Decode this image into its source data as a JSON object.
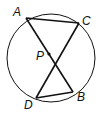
{
  "diagram": {
    "type": "circle-intersecting-chords",
    "colors": {
      "stroke": "#111111",
      "background": "#ffffff"
    },
    "circle": {
      "cx": 51,
      "cy": 58,
      "r": 44
    },
    "points": {
      "A": {
        "label": "A",
        "x": 26,
        "y": 18,
        "lx": 13,
        "ly": 16
      },
      "C": {
        "label": "C",
        "x": 79,
        "y": 23,
        "lx": 82,
        "ly": 25
      },
      "P": {
        "label": "P",
        "x": 49,
        "y": 54,
        "lx": 36,
        "ly": 60
      },
      "D": {
        "label": "D",
        "x": 36,
        "y": 98,
        "lx": 24,
        "ly": 109
      },
      "B": {
        "label": "B",
        "x": 73,
        "y": 92,
        "lx": 77,
        "ly": 101
      }
    },
    "segments": [
      {
        "from": "A",
        "to": "C",
        "name": "AC"
      },
      {
        "from": "A",
        "to": "B",
        "name": "AB"
      },
      {
        "from": "C",
        "to": "D",
        "name": "CD"
      },
      {
        "from": "D",
        "to": "B",
        "name": "DB"
      }
    ]
  }
}
